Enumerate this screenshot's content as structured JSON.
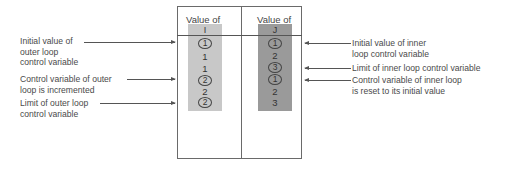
{
  "diagram": {
    "outer_column": {
      "header": "Value of",
      "variable": "I",
      "values": [
        {
          "text": "1",
          "circled": true
        },
        {
          "text": "1",
          "circled": false
        },
        {
          "text": "1",
          "circled": false
        },
        {
          "text": "2",
          "circled": true
        },
        {
          "text": "2",
          "circled": false
        },
        {
          "text": "2",
          "circled": true
        }
      ],
      "fill_color": "#c8c8c8"
    },
    "inner_column": {
      "header": "Value of",
      "variable": "J",
      "values": [
        {
          "text": "1",
          "circled": true
        },
        {
          "text": "2",
          "circled": false
        },
        {
          "text": "3",
          "circled": true
        },
        {
          "text": "1",
          "circled": true
        },
        {
          "text": "2",
          "circled": false
        },
        {
          "text": "3",
          "circled": false
        }
      ],
      "fill_color": "#9a9a9a"
    },
    "left_labels": [
      {
        "lines": [
          "Initial value of",
          "outer loop",
          "control variable"
        ]
      },
      {
        "lines": [
          "Control variable of outer",
          "loop is incremented"
        ]
      },
      {
        "lines": [
          "Limit of outer loop",
          "control variable"
        ]
      }
    ],
    "right_labels": [
      {
        "lines": [
          "Initial value of inner",
          "loop control variable"
        ]
      },
      {
        "lines": [
          "Limit of inner loop control variable"
        ]
      },
      {
        "lines": [
          "Control variable of inner loop",
          "is reset to its initial value"
        ]
      }
    ]
  }
}
